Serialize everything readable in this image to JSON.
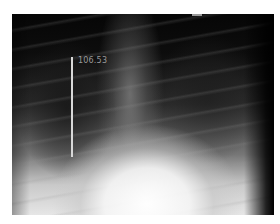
{
  "image": {
    "description": "Frontal chest radiograph",
    "background_color": "#ffffff"
  },
  "annotation": {
    "measurement_label": "106.53",
    "line_color": "#d8d8d8",
    "label_color": "#9a9a9a"
  }
}
